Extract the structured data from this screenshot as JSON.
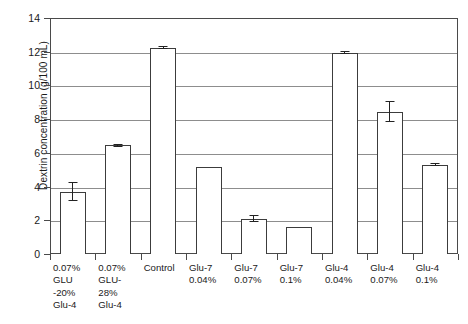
{
  "chart_data": {
    "type": "bar",
    "title": "",
    "xlabel": "",
    "ylabel": "Dextrin concentration (g/100 mL)",
    "ylim": [
      0,
      14
    ],
    "ytick_step": 2,
    "yticks": [
      "14",
      "12",
      "10",
      "8",
      "6",
      "4",
      "2",
      "0"
    ],
    "grid": true,
    "legend": "none",
    "categories": [
      "0.07% GLU -20% Glu-4",
      "0.07% GLU- 28% Glu-4",
      "Control",
      "Glu-7 0.04%",
      "Glu-7 0.07%",
      "Glu-7 0.1%",
      "Glu-4 0.04%",
      "Glu-4 0.07%",
      "Glu-4 0.1%"
    ],
    "category_lines": [
      [
        "0.07%",
        "GLU",
        "-20%",
        "Glu-4"
      ],
      [
        "0.07%",
        "GLU-",
        "28%",
        "Glu-4"
      ],
      [
        "Control"
      ],
      [
        "Glu-7",
        "0.04%"
      ],
      [
        "Glu-7",
        "0.07%"
      ],
      [
        "Glu-7",
        "0.1%"
      ],
      [
        "Glu-4",
        "0.04%"
      ],
      [
        "Glu-4",
        "0.07%"
      ],
      [
        "Glu-4",
        "0.1%"
      ]
    ],
    "values": [
      3.7,
      6.45,
      12.25,
      5.15,
      2.1,
      1.6,
      11.95,
      8.45,
      5.3
    ],
    "errors": [
      0.55,
      0.1,
      0.1,
      0.0,
      0.2,
      0.0,
      0.1,
      0.6,
      0.1
    ],
    "bar_facecolor": "#ffffff",
    "bar_edgecolor": "#3c3c3c",
    "gridline_color": "#8d8d8d",
    "axis_color": "#4a4a4a",
    "text_color": "#1a1a1a"
  }
}
